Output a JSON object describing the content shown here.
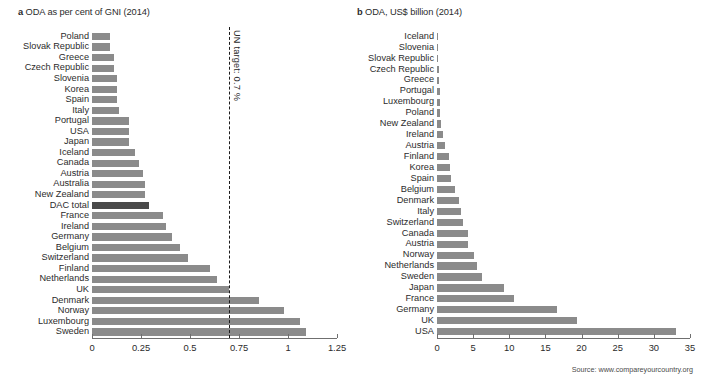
{
  "source_note": "Source: www.compareyourcountry.org",
  "chart_data": [
    {
      "type": "bar",
      "orientation": "horizontal",
      "panel_letter": "a",
      "title": "ODA as per cent of GNI (2014)",
      "xlabel": "",
      "ylabel": "",
      "xlim": [
        0,
        1.25
      ],
      "xticks": [
        0,
        0.25,
        0.5,
        0.75,
        1,
        1.25
      ],
      "xticklabels": [
        "0",
        "0.25",
        "0.5",
        "0.75",
        "1",
        "1.25"
      ],
      "grid": false,
      "legend": "none",
      "bar_color": "#8b8b8b",
      "highlight_color": "#4a4a4a",
      "highlight_category": "DAC total",
      "annotation": {
        "label": "UN target: 0.7 %",
        "value": 0.7,
        "style": "dashed-vertical-line",
        "color": "#1a1a1a"
      },
      "categories": [
        "Poland",
        "Slovak Republic",
        "Greece",
        "Czech Republic",
        "Slovenia",
        "Korea",
        "Spain",
        "Italy",
        "Portugal",
        "USA",
        "Japan",
        "Iceland",
        "Canada",
        "Austria",
        "Australia",
        "New Zealand",
        "DAC total",
        "France",
        "Ireland",
        "Germany",
        "Belgium",
        "Switzerland",
        "Finland",
        "Netherlands",
        "UK",
        "Denmark",
        "Norway",
        "Luxembourg",
        "Sweden"
      ],
      "values": [
        0.09,
        0.09,
        0.11,
        0.11,
        0.13,
        0.13,
        0.13,
        0.14,
        0.19,
        0.19,
        0.19,
        0.22,
        0.24,
        0.26,
        0.27,
        0.27,
        0.29,
        0.36,
        0.38,
        0.41,
        0.45,
        0.49,
        0.6,
        0.64,
        0.7,
        0.85,
        0.98,
        1.06,
        1.09
      ]
    },
    {
      "type": "bar",
      "orientation": "horizontal",
      "panel_letter": "b",
      "title": "ODA, US$ billion (2014)",
      "xlabel": "",
      "ylabel": "",
      "xlim": [
        0,
        35
      ],
      "xticks": [
        0,
        5,
        10,
        15,
        20,
        25,
        30,
        35
      ],
      "xticklabels": [
        "0",
        "5",
        "10",
        "15",
        "20",
        "25",
        "30",
        "35"
      ],
      "grid": false,
      "legend": "none",
      "bar_color": "#8b8b8b",
      "categories": [
        "Iceland",
        "Slovenia",
        "Slovak Republic",
        "Czech Republic",
        "Greece",
        "Portugal",
        "Luxembourg",
        "Poland",
        "New Zealand",
        "Ireland",
        "Austria",
        "Finland",
        "Korea",
        "Spain",
        "Belgium",
        "Denmark",
        "Italy",
        "Switzerland",
        "Canada",
        "Austria",
        "Norway",
        "Netherlands",
        "Sweden",
        "Japan",
        "France",
        "Germany",
        "UK",
        "USA"
      ],
      "values": [
        0.04,
        0.06,
        0.08,
        0.21,
        0.25,
        0.43,
        0.42,
        0.45,
        0.51,
        0.81,
        1.14,
        1.63,
        1.86,
        1.88,
        2.45,
        2.99,
        3.34,
        3.54,
        4.24,
        4.25,
        5.09,
        5.57,
        6.23,
        9.27,
        10.62,
        16.57,
        19.31,
        33.1
      ]
    }
  ]
}
